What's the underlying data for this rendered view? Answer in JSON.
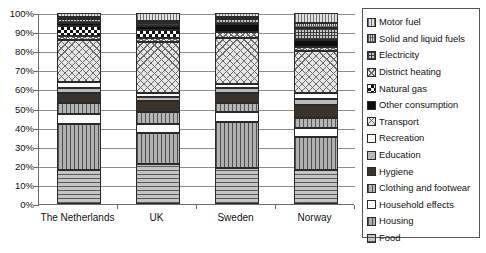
{
  "chart_data": {
    "type": "bar",
    "subtype": "stacked-100-percent",
    "title": "",
    "xlabel": "",
    "ylabel": "",
    "ylim": [
      0,
      100
    ],
    "ytick_labels": [
      "0%",
      "10%",
      "20%",
      "30%",
      "40%",
      "50%",
      "60%",
      "70%",
      "80%",
      "90%",
      "100%"
    ],
    "ytick_values": [
      0,
      10,
      20,
      30,
      40,
      50,
      60,
      70,
      80,
      90,
      100
    ],
    "grid": true,
    "legend_position": "right",
    "categories": [
      "The Netherlands",
      "UK",
      "Sweden",
      "Norway"
    ],
    "series": [
      {
        "name": "Food",
        "pattern": "horizontal-lines",
        "values": [
          18,
          21,
          19,
          18
        ]
      },
      {
        "name": "Housing",
        "pattern": "vertical-lines",
        "values": [
          24,
          16,
          24,
          17
        ]
      },
      {
        "name": "Household effects",
        "pattern": "white-solid",
        "values": [
          5,
          5,
          5,
          5
        ]
      },
      {
        "name": "Clothing and footwear",
        "pattern": "vertical-lines-light",
        "values": [
          6,
          6,
          5,
          5
        ]
      },
      {
        "name": "Hygiene",
        "pattern": "dark-solid",
        "values": [
          5,
          6,
          5,
          7
        ]
      },
      {
        "name": "Education",
        "pattern": "grey-solid",
        "values": [
          3,
          2,
          3,
          3
        ]
      },
      {
        "name": "Recreation",
        "pattern": "white",
        "values": [
          3,
          2,
          2,
          3
        ]
      },
      {
        "name": "Transport",
        "pattern": "cross-hatch-wide",
        "values": [
          22,
          27,
          24,
          22
        ]
      },
      {
        "name": "District heating",
        "pattern": "cross-hatch",
        "values": [
          2,
          2,
          3,
          2
        ]
      },
      {
        "name": "Natural gas",
        "pattern": "checkerboard",
        "values": [
          5,
          4,
          0,
          0
        ]
      },
      {
        "name": "Other consumption",
        "pattern": "black-solid",
        "values": [
          2,
          2,
          4,
          4
        ]
      },
      {
        "name": "Electricity",
        "pattern": "dense-grid",
        "values": [
          2,
          2,
          3,
          6
        ]
      },
      {
        "name": "Solid and liquid fuels",
        "pattern": "fine-cross",
        "values": [
          1,
          1,
          1,
          3
        ]
      },
      {
        "name": "Motor fuel",
        "pattern": "vertical-stripe",
        "values": [
          2,
          4,
          2,
          5
        ]
      }
    ]
  },
  "legend": {
    "items": [
      {
        "label": "Motor fuel",
        "swatch": "p-motorfuel"
      },
      {
        "label": "Solid and liquid fuels",
        "swatch": "p-solidliquid"
      },
      {
        "label": "Electricity",
        "swatch": "p-electricity"
      },
      {
        "label": "District heating",
        "swatch": "p-districtheat"
      },
      {
        "label": "Natural gas",
        "swatch": "p-naturalgas"
      },
      {
        "label": "Other consumption",
        "swatch": "p-other"
      },
      {
        "label": "Transport",
        "swatch": "p-transport"
      },
      {
        "label": "Recreation",
        "swatch": "p-recreation"
      },
      {
        "label": "Education",
        "swatch": "p-education"
      },
      {
        "label": "Hygiene",
        "swatch": "p-hygiene"
      },
      {
        "label": "Clothing and footwear",
        "swatch": "p-clothing"
      },
      {
        "label": "Household effects",
        "swatch": "p-household"
      },
      {
        "label": "Housing",
        "swatch": "p-housing"
      },
      {
        "label": "Food",
        "swatch": "p-food"
      }
    ]
  },
  "style": {
    "axis_color": "#6b6b6b",
    "grid_color": "#8d8d8d",
    "border_color": "#555555",
    "text_color": "#111111",
    "background": "#ffffff"
  }
}
